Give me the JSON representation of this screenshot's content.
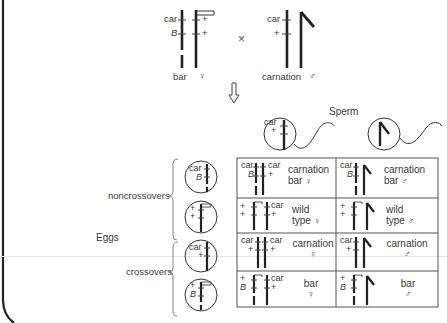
{
  "parents": {
    "female": {
      "label": "bar",
      "sex_symbol": "♀",
      "loci": [
        {
          "name": "car",
          "left": "car",
          "right": "+"
        },
        {
          "name": "B",
          "left": "B",
          "right": "+"
        }
      ]
    },
    "cross_symbol": "×",
    "male": {
      "label": "carnation",
      "sex_symbol": "♂",
      "loci": [
        {
          "name": "car",
          "left": "car"
        },
        {
          "name": "+",
          "left": "+"
        }
      ]
    }
  },
  "arrow": "down-arrow",
  "sperm": {
    "title": "Sperm",
    "types": [
      {
        "labels": [
          "car",
          "+"
        ],
        "description": "X chromosome sperm"
      },
      {
        "labels": [],
        "description": "Y chromosome sperm"
      }
    ]
  },
  "eggs": {
    "title": "Eggs",
    "groups": [
      {
        "label": "noncrossovers",
        "eggs": [
          {
            "labels": [
              "car",
              "B"
            ]
          },
          {
            "labels": [
              "+",
              "+"
            ]
          }
        ]
      },
      {
        "label": "crossovers",
        "eggs": [
          {
            "labels": [
              "car",
              "+"
            ]
          },
          {
            "labels": [
              "+",
              "B"
            ]
          }
        ]
      }
    ]
  },
  "punnett": {
    "rows": [
      {
        "female": {
          "left": [
            "car",
            "B"
          ],
          "right": [
            "car",
            "+"
          ],
          "line1": "carnation",
          "line2": "bar",
          "sex": "♀"
        },
        "male": {
          "left": [
            "car",
            "B"
          ],
          "line1": "carnation",
          "line2": "bar",
          "sex": "♂"
        }
      },
      {
        "female": {
          "left": [
            "+",
            "+"
          ],
          "right": [
            "car",
            "+"
          ],
          "line1": "wild",
          "line2": "type",
          "sex": "♀"
        },
        "male": {
          "left": [
            "+",
            "+"
          ],
          "line1": "wild",
          "line2": "type",
          "sex": "♂"
        }
      },
      {
        "female": {
          "left": [
            "car",
            "+"
          ],
          "right": [
            "car",
            "+"
          ],
          "line1": "carnation",
          "line2": "",
          "sex": "♀"
        },
        "male": {
          "left": [
            "car",
            "+"
          ],
          "line1": "carnation",
          "line2": "",
          "sex": "♂"
        }
      },
      {
        "female": {
          "left": [
            "+",
            "B"
          ],
          "right": [
            "car",
            "+"
          ],
          "line1": "bar",
          "line2": "",
          "sex": "♀"
        },
        "male": {
          "left": [
            "+",
            "B"
          ],
          "line1": "bar",
          "line2": "",
          "sex": "♂"
        }
      }
    ]
  },
  "colors": {
    "ink": "#222222",
    "text": "#3a3a3a",
    "grid": "#555555",
    "background": "#ffffff"
  }
}
